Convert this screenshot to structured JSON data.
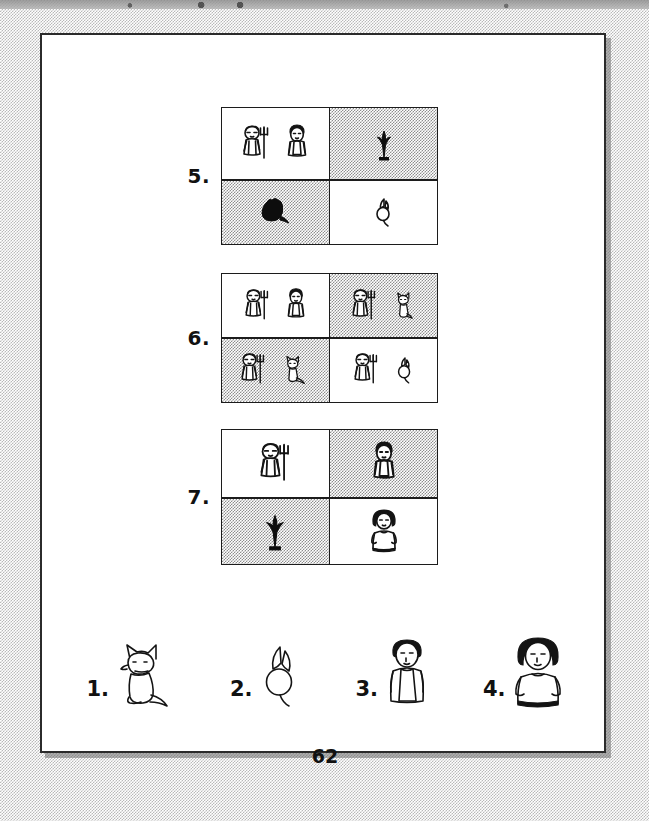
{
  "page": {
    "page_number": "62",
    "background": "#ffffff",
    "frame_color": "#2b2b2b",
    "shade_color": "#8e8e8e"
  },
  "exercises": [
    {
      "number": "5.",
      "cells": [
        {
          "shade": "white",
          "figures": [
            "farmer-with-rake",
            "person-in-apron"
          ]
        },
        {
          "shade": "gray",
          "figures": [
            "plant-silhouette"
          ]
        },
        {
          "shade": "gray",
          "figures": [
            "dog-silhouette"
          ]
        },
        {
          "shade": "white",
          "figures": [
            "radish"
          ]
        }
      ]
    },
    {
      "number": "6.",
      "cells": [
        {
          "shade": "white",
          "figures": [
            "farmer-with-rake",
            "person-in-apron"
          ]
        },
        {
          "shade": "gray",
          "figures": [
            "farmer-with-rake",
            "dog"
          ]
        },
        {
          "shade": "gray",
          "figures": [
            "farmer-with-rake",
            "dog"
          ]
        },
        {
          "shade": "white",
          "figures": [
            "farmer-with-rake",
            "radish"
          ]
        }
      ]
    },
    {
      "number": "7.",
      "cells": [
        {
          "shade": "white",
          "figures": [
            "farmer-with-rake"
          ]
        },
        {
          "shade": "gray",
          "figures": [
            "person-in-apron"
          ]
        },
        {
          "shade": "gray",
          "figures": [
            "plant-silhouette"
          ]
        },
        {
          "shade": "white",
          "figures": [
            "woman"
          ]
        }
      ]
    }
  ],
  "legend": {
    "items": [
      {
        "number": "1.",
        "figure": "dog"
      },
      {
        "number": "2.",
        "figure": "radish"
      },
      {
        "number": "3.",
        "figure": "person-in-apron"
      },
      {
        "number": "4.",
        "figure": "woman"
      }
    ]
  }
}
